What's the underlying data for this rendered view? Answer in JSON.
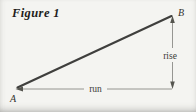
{
  "figure": {
    "caption": "Figure 1",
    "labels": {
      "point_a": "A",
      "point_b": "B",
      "rise": "rise",
      "run": "run"
    },
    "colors": {
      "background": "#f4f4f1",
      "segment_line": "#3f3f3d",
      "measure_line": "#8b8b87",
      "arrowhead": "#55554f",
      "text": "#33332f"
    }
  }
}
